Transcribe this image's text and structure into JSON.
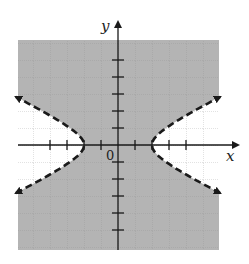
{
  "chart_data": {
    "type": "line",
    "title": "",
    "xlabel": "x",
    "ylabel": "y",
    "origin_label": "0",
    "xlim": [
      -6,
      6
    ],
    "ylim": [
      -6,
      6
    ],
    "grid": true,
    "unit_px": 17,
    "x_ticks": [
      -4,
      -3,
      -2,
      -1,
      1,
      2,
      3,
      4
    ],
    "y_ticks": [
      -5,
      -4,
      -3,
      -2,
      -1,
      1,
      2,
      3,
      4,
      5
    ],
    "boundary": {
      "equation": "x^2/4 - y^2 = 1",
      "style": "dashed",
      "vertices": [
        [
          -2,
          0
        ],
        [
          2,
          0
        ]
      ],
      "branch_endpoints": [
        [
          -6,
          2.83
        ],
        [
          -6,
          -2.83
        ],
        [
          6,
          2.83
        ],
        [
          6,
          -2.83
        ]
      ],
      "arrows": true
    },
    "shaded_region": "x^2/4 - y^2 < 1",
    "colors": {
      "shade": "#b4b4b4",
      "grid": "#8a8a8a",
      "axis": "#1a1a1a",
      "curve": "#1a1a1a",
      "unshaded": "#ffffff"
    }
  }
}
